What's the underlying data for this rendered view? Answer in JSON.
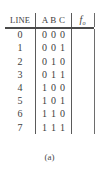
{
  "figure": {
    "caption": "(a)"
  },
  "table": {
    "headers": {
      "line": "LINE",
      "inputs": "A B C",
      "output_symbol": "f",
      "output_subscript": "o"
    },
    "rows": [
      {
        "line": "0",
        "a": "0",
        "b": "0",
        "c": "0",
        "out": ""
      },
      {
        "line": "1",
        "a": "0",
        "b": "0",
        "c": "1",
        "out": ""
      },
      {
        "line": "2",
        "a": "0",
        "b": "1",
        "c": "0",
        "out": ""
      },
      {
        "line": "3",
        "a": "0",
        "b": "1",
        "c": "1",
        "out": ""
      },
      {
        "line": "4",
        "a": "1",
        "b": "0",
        "c": "0",
        "out": ""
      },
      {
        "line": "5",
        "a": "1",
        "b": "0",
        "c": "1",
        "out": ""
      },
      {
        "line": "6",
        "a": "1",
        "b": "1",
        "c": "0",
        "out": ""
      },
      {
        "line": "7",
        "a": "1",
        "b": "1",
        "c": "1",
        "out": ""
      }
    ]
  },
  "colors": {
    "text": "#3d3d3d",
    "rule": "#4a4a4a",
    "separator": "#5a5a5a",
    "background": "#ffffff"
  }
}
